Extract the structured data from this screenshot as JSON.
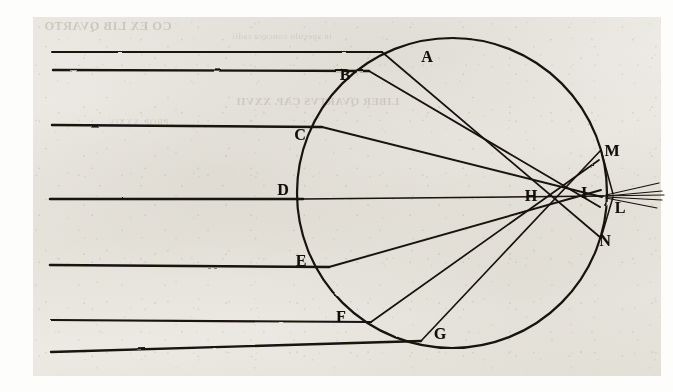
{
  "page": {
    "width": 673,
    "height": 392,
    "background_color": "#ffffff",
    "paper_color": "#eceae2",
    "ink_color": "#15120d"
  },
  "bleed_through": {
    "description": "mirrored show-through of letterpress text from the reverse of the leaf",
    "head": "CO EX LIB QVARTO",
    "line1": "in speculo concavo radii",
    "line2": "LIBER QVARTVS CAP. XXVII",
    "line3": "PROP. XXXIV"
  },
  "figure": {
    "sphere": {
      "cx": 452,
      "cy": 193,
      "r": 155
    },
    "focus": {
      "x": 610,
      "y": 196,
      "label": "L"
    },
    "labels": [
      {
        "id": "A",
        "text": "A",
        "x": 427,
        "y": 57
      },
      {
        "id": "B",
        "text": "B",
        "x": 345,
        "y": 75
      },
      {
        "id": "C",
        "text": "C",
        "x": 300,
        "y": 135
      },
      {
        "id": "D",
        "text": "D",
        "x": 283,
        "y": 190
      },
      {
        "id": "E",
        "text": "E",
        "x": 301,
        "y": 261
      },
      {
        "id": "F",
        "text": "F",
        "x": 341,
        "y": 317
      },
      {
        "id": "G",
        "text": "G",
        "x": 440,
        "y": 334
      },
      {
        "id": "H",
        "text": "H",
        "x": 531,
        "y": 196
      },
      {
        "id": "I",
        "text": "I",
        "x": 584,
        "y": 193
      },
      {
        "id": "L",
        "text": "L",
        "x": 620,
        "y": 208
      },
      {
        "id": "M",
        "text": "M",
        "x": 612,
        "y": 151
      },
      {
        "id": "N",
        "text": "N",
        "x": 605,
        "y": 241
      }
    ],
    "incident_rays": [
      {
        "name": "ray-a",
        "y_start": 52,
        "x_start": 52,
        "hit": {
          "x": 382,
          "y": 52
        }
      },
      {
        "name": "ray-b",
        "y_start": 70,
        "x_start": 53,
        "hit": {
          "x": 369,
          "y": 71
        }
      },
      {
        "name": "ray-c",
        "y_start": 125,
        "x_start": 52,
        "hit": {
          "x": 322,
          "y": 127
        }
      },
      {
        "name": "ray-d",
        "y_start": 199,
        "x_start": 50,
        "hit": {
          "x": 303,
          "y": 199
        }
      },
      {
        "name": "ray-e",
        "y_start": 265,
        "x_start": 50,
        "hit": {
          "x": 329,
          "y": 267
        }
      },
      {
        "name": "ray-f",
        "y_start": 320,
        "x_start": 51,
        "hit": {
          "x": 371,
          "y": 322
        }
      },
      {
        "name": "ray-g",
        "y_start": 352,
        "x_start": 51,
        "hit": {
          "x": 421,
          "y": 341
        }
      }
    ],
    "refracted_chords": [
      {
        "name": "chord-a-n",
        "from": {
          "x": 382,
          "y": 52
        },
        "to": {
          "x": 601,
          "y": 238
        }
      },
      {
        "name": "chord-b-i",
        "from": {
          "x": 369,
          "y": 71
        },
        "to": {
          "x": 598,
          "y": 208
        }
      },
      {
        "name": "chord-c-i",
        "from": {
          "x": 322,
          "y": 127
        },
        "to": {
          "x": 600,
          "y": 196
        }
      },
      {
        "name": "chord-d-i",
        "from": {
          "x": 303,
          "y": 199
        },
        "to": {
          "x": 601,
          "y": 196
        }
      },
      {
        "name": "chord-e-i",
        "from": {
          "x": 329,
          "y": 267
        },
        "to": {
          "x": 600,
          "y": 190
        }
      },
      {
        "name": "chord-f-m",
        "from": {
          "x": 371,
          "y": 322
        },
        "to": {
          "x": 598,
          "y": 160
        }
      },
      {
        "name": "chord-g-m",
        "from": {
          "x": 421,
          "y": 341
        },
        "to": {
          "x": 600,
          "y": 150
        }
      }
    ],
    "exit_rays": [
      {
        "name": "exit-from-n",
        "from": {
          "x": 601,
          "y": 238
        },
        "to": {
          "x": 612,
          "y": 198
        }
      },
      {
        "name": "exit-from-m",
        "from": {
          "x": 600,
          "y": 150
        },
        "to": {
          "x": 612,
          "y": 194
        }
      },
      {
        "name": "exit-spread-1",
        "from": {
          "x": 608,
          "y": 196
        },
        "to": {
          "x": 660,
          "y": 184
        }
      },
      {
        "name": "exit-spread-2",
        "from": {
          "x": 608,
          "y": 196
        },
        "to": {
          "x": 662,
          "y": 192
        }
      },
      {
        "name": "exit-spread-3",
        "from": {
          "x": 608,
          "y": 196
        },
        "to": {
          "x": 662,
          "y": 200
        }
      },
      {
        "name": "exit-spread-4",
        "from": {
          "x": 608,
          "y": 196
        },
        "to": {
          "x": 658,
          "y": 208
        }
      }
    ]
  }
}
